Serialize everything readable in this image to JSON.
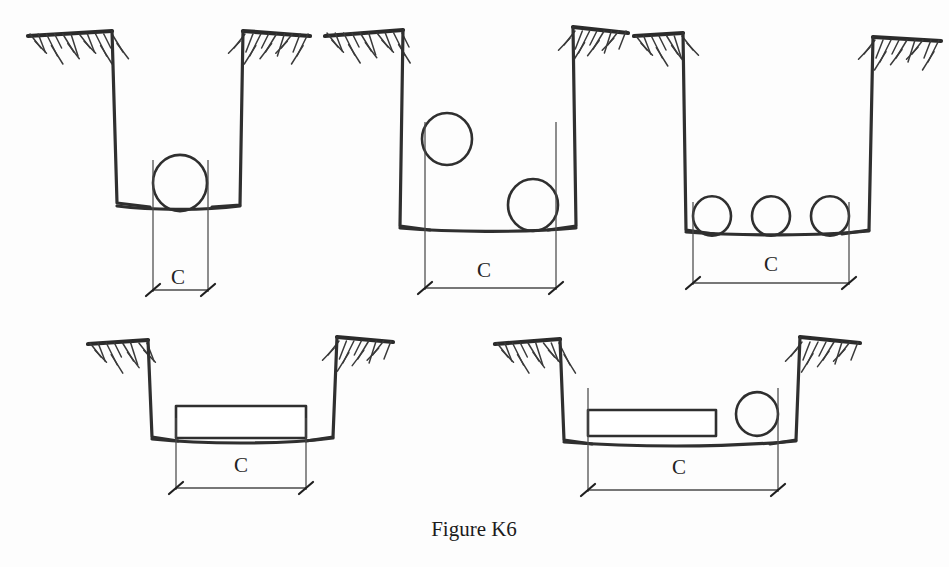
{
  "figure": {
    "caption": "Figure K6",
    "caption_x": 474,
    "caption_y": 536,
    "background_color": "#fdfdfd",
    "line_color": "#2f2f2f",
    "ground_color": "#2b2b2b",
    "dimension_color": "#4a4a4a",
    "width": 949,
    "height": 567
  },
  "chart_data": {
    "type": "diagram",
    "title": "Figure K6",
    "dimension_symbol": "C",
    "panels": [
      {
        "id": "panel-1",
        "index": 1,
        "row": "top",
        "label": "C",
        "contents": "single circular conduit resting on trench bottom",
        "conduit_count": 1,
        "conduit_type": "circle"
      },
      {
        "id": "panel-2",
        "index": 2,
        "row": "top",
        "label": "C",
        "contents": "two circular conduits, one raised at left and one resting on bottom at right",
        "conduit_count": 2,
        "conduit_type": "circle"
      },
      {
        "id": "panel-3",
        "index": 3,
        "row": "top",
        "label": "C",
        "contents": "three circular conduits side by side on trench bottom",
        "conduit_count": 3,
        "conduit_type": "circle"
      },
      {
        "id": "panel-4",
        "index": 4,
        "row": "bottom",
        "label": "C",
        "contents": "single rectangular duct bank resting on trench bottom",
        "conduit_count": 1,
        "conduit_type": "rectangle"
      },
      {
        "id": "panel-5",
        "index": 5,
        "row": "bottom",
        "label": "C",
        "contents": "flat rectangular duct bank at left plus one circular conduit at right",
        "conduit_count": 2,
        "conduit_type": "rectangle-and-circle"
      }
    ]
  },
  "panels": {
    "p1": {
      "dim_label": "C",
      "dim_label_x": 178,
      "dim_label_y": 284,
      "ground_left": "M 28 36 L 112 31",
      "ground_right": "M 243 31 L 310 36",
      "wall_left": "M 112 31 L 117 203 L 150 207",
      "wall_right": "M 243 31 L 240 205 L 212 207",
      "floor": "M 117 206 C 150 210 200 211 240 206",
      "circle": {
        "cx": 180,
        "cy": 183,
        "r": 27
      },
      "ext_left_x": 153,
      "ext_right_x": 208,
      "ext_top_y": 160,
      "ext_bottom_y": 292,
      "dim_y": 290,
      "dim_x1": 153,
      "dim_x2": 208,
      "hatch_left": {
        "x1": 30,
        "x2": 112,
        "y": 33,
        "n": 11,
        "dir": 1
      },
      "hatch_right": {
        "x1": 245,
        "x2": 308,
        "y": 33,
        "n": 9,
        "dir": -1
      }
    },
    "p2": {
      "dim_label": "C",
      "dim_label_x": 484,
      "dim_label_y": 277,
      "ground_left": "M 325 36 L 403 30",
      "ground_right": "M 573 27 L 628 33",
      "wall_left": "M 403 30 L 400 226 L 430 230",
      "wall_right": "M 573 27 L 576 226 L 548 230",
      "floor": "M 400 228 C 450 232 520 233 576 228",
      "circles": [
        {
          "cx": 447,
          "cy": 139,
          "r": 25
        },
        {
          "cx": 533,
          "cy": 205,
          "r": 25
        }
      ],
      "ext_left_x": 425,
      "ext_right_x": 556,
      "ext_top_y": 122,
      "ext_bottom_y": 290,
      "dim_y": 288,
      "dim_x1": 425,
      "dim_x2": 556,
      "hatch_left": {
        "x1": 327,
        "x2": 402,
        "y": 32,
        "n": 10,
        "dir": 1
      },
      "hatch_right": {
        "x1": 575,
        "x2": 626,
        "y": 30,
        "n": 8,
        "dir": -1
      }
    },
    "p3": {
      "dim_label": "C",
      "dim_label_x": 771,
      "dim_label_y": 271,
      "ground_left": "M 634 36 L 683 33",
      "ground_right": "M 873 37 L 941 41",
      "wall_left": "M 683 33 L 686 230 L 714 234",
      "wall_right": "M 873 37 L 869 230 L 842 234",
      "floor": "M 686 232 C 740 236 820 236 869 231",
      "circles": [
        {
          "cx": 712,
          "cy": 216,
          "r": 19
        },
        {
          "cx": 771,
          "cy": 216,
          "r": 19
        },
        {
          "cx": 830,
          "cy": 216,
          "r": 19
        }
      ],
      "ext_left_x": 693,
      "ext_right_x": 849,
      "ext_top_y": 202,
      "ext_bottom_y": 285,
      "dim_y": 283,
      "dim_x1": 693,
      "dim_x2": 849,
      "hatch_left": {
        "x1": 636,
        "x2": 682,
        "y": 35,
        "n": 7,
        "dir": 1
      },
      "hatch_right": {
        "x1": 875,
        "x2": 939,
        "y": 39,
        "n": 9,
        "dir": -1
      }
    },
    "p4": {
      "dim_label": "C",
      "dim_label_x": 241,
      "dim_label_y": 472,
      "ground_left": "M 88 344 L 148 340",
      "ground_right": "M 337 337 L 393 342",
      "wall_left": "M 148 340 L 152 437 L 178 441",
      "wall_right": "M 337 337 L 333 437 L 306 441",
      "floor": "M 152 439 C 200 444 280 445 333 438",
      "box": {
        "x": 176,
        "y": 406,
        "w": 130,
        "h": 32
      },
      "ext_left_x": 176,
      "ext_right_x": 306,
      "ext_top_y": 418,
      "ext_bottom_y": 490,
      "dim_y": 488,
      "dim_x1": 176,
      "dim_x2": 306,
      "hatch_left": {
        "x1": 90,
        "x2": 147,
        "y": 342,
        "n": 8,
        "dir": 1
      },
      "hatch_right": {
        "x1": 339,
        "x2": 391,
        "y": 340,
        "n": 8,
        "dir": -1
      }
    },
    "p5": {
      "dim_label": "C",
      "dim_label_x": 679,
      "dim_label_y": 474,
      "ground_left": "M 495 344 L 560 339",
      "ground_right": "M 800 337 L 860 343",
      "wall_left": "M 560 339 L 564 440 L 592 444",
      "wall_right": "M 800 337 L 796 440 L 770 444",
      "floor": "M 564 442 C 630 447 720 448 796 441",
      "box": {
        "x": 588,
        "y": 410,
        "w": 128,
        "h": 26
      },
      "circle": {
        "cx": 757,
        "cy": 414,
        "r": 21
      },
      "ext_left_x": 588,
      "ext_right_x": 778,
      "ext_top_y": 388,
      "ext_bottom_y": 492,
      "dim_y": 490,
      "dim_x1": 588,
      "dim_x2": 778,
      "hatch_left": {
        "x1": 497,
        "x2": 559,
        "y": 342,
        "n": 9,
        "dir": 1
      },
      "hatch_right": {
        "x1": 802,
        "x2": 858,
        "y": 341,
        "n": 8,
        "dir": -1
      }
    }
  }
}
